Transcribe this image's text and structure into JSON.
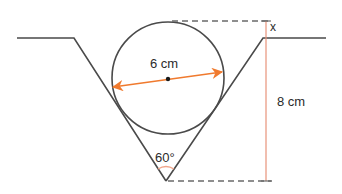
{
  "diagram": {
    "labels": {
      "diameter": "6 cm",
      "height": "8 cm",
      "unknown": "x",
      "angle": "60°"
    },
    "colors": {
      "line": "#4a4a4a",
      "dashed": "#6a6a6a",
      "accent_arrow": "#f07a2e",
      "accent_height": "#e8937a",
      "angle_arc": "#f0a58a",
      "text": "#2b2b2b"
    },
    "geometry": {
      "ground_y": 38,
      "left_ground": [
        17,
        74
      ],
      "right_ground": [
        263,
        326
      ],
      "apex": [
        166,
        181
      ],
      "circle_center": [
        168,
        78
      ],
      "circle_radius": 56,
      "top_dash_y": 21,
      "bottom_dash_y": 181,
      "height_line_x": 266
    }
  }
}
